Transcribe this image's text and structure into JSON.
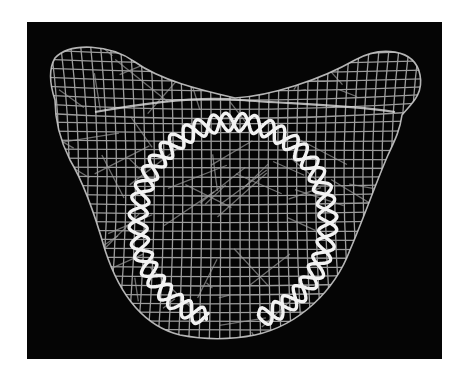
{
  "figure": {
    "background_color": "#050505",
    "mesh_color": "#b8b8b8",
    "helix_color": "#f2f2f2",
    "helix_turns": 22
  }
}
